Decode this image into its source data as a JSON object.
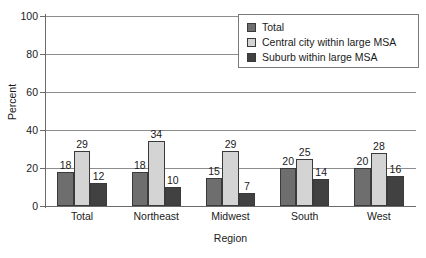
{
  "chart_data": {
    "type": "bar",
    "title": "",
    "xlabel": "Region",
    "ylabel": "Percent",
    "categories": [
      "Total",
      "Northeast",
      "Midwest",
      "South",
      "West"
    ],
    "series": [
      {
        "name": "Total",
        "color": "#6e6e6e",
        "values": [
          18,
          18,
          15,
          20,
          20
        ]
      },
      {
        "name": "Central city within large MSA",
        "color": "#d4d4d4",
        "values": [
          29,
          34,
          29,
          25,
          28
        ]
      },
      {
        "name": "Suburb within large MSA",
        "color": "#414141",
        "values": [
          12,
          10,
          7,
          14,
          16
        ]
      }
    ],
    "ylim": [
      0,
      100
    ],
    "yticks": [
      0,
      20,
      40,
      60,
      80,
      100
    ],
    "ytick_labels": [
      "0",
      "20",
      "40",
      "60",
      "80",
      "100"
    ],
    "grid": true,
    "grid_axis": "y",
    "legend_position": "top-right",
    "data_labels": true
  },
  "legend": {
    "items": [
      {
        "label": "Total",
        "color": "#6e6e6e"
      },
      {
        "label": "Central city within large MSA",
        "color": "#d4d4d4"
      },
      {
        "label": "Suburb within large MSA",
        "color": "#414141"
      }
    ]
  },
  "caption": {
    "fragment": ""
  }
}
